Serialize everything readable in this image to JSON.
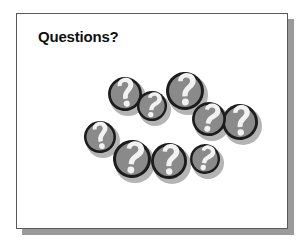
{
  "slide": {
    "title": "Questions?",
    "background_color": "#ffffff",
    "border_color": "#5a5a5a",
    "shadow_color": "#9a9a9a",
    "title_color": "#101010"
  },
  "graphic": {
    "name": "question-mark-cluster",
    "description": "Cluster of overlapping gray coins each bearing a white question mark",
    "coin_fill_color": "#8a8a8a",
    "coin_outline_color": "#1c1c1c",
    "question_mark_color": "#f2f2f2",
    "coin_shadow_color": "#b4b4b4",
    "coin_count": 9,
    "coins": [
      {
        "label": "question-coin-1",
        "cx": 86,
        "cy": 50,
        "r": 17,
        "rot": -12
      },
      {
        "label": "question-coin-2",
        "cx": 113,
        "cy": 62,
        "r": 15,
        "rot": 6
      },
      {
        "label": "question-coin-3",
        "cx": 146,
        "cy": 47,
        "r": 19,
        "rot": -4
      },
      {
        "label": "question-coin-4",
        "cx": 170,
        "cy": 75,
        "r": 17,
        "rot": 8
      },
      {
        "label": "question-coin-5",
        "cx": 201,
        "cy": 78,
        "r": 18,
        "rot": -6
      },
      {
        "label": "question-coin-6",
        "cx": 61,
        "cy": 93,
        "r": 16,
        "rot": -14
      },
      {
        "label": "question-coin-7",
        "cx": 93,
        "cy": 115,
        "r": 19,
        "rot": 4
      },
      {
        "label": "question-coin-8",
        "cx": 130,
        "cy": 117,
        "r": 18,
        "rot": -3
      },
      {
        "label": "question-coin-9",
        "cx": 166,
        "cy": 115,
        "r": 15,
        "rot": 10
      }
    ]
  }
}
